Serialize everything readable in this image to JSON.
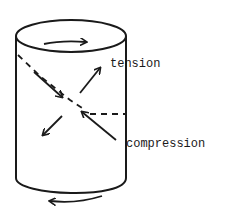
{
  "figure": {
    "type": "diagram",
    "labels": {
      "tension": "tension",
      "compression": "compression"
    },
    "elements": [
      {
        "name": "cylinder",
        "description": "vertical cylinder with elliptical top and curved bottom"
      },
      {
        "name": "top-rotation-arrow",
        "direction": "right"
      },
      {
        "name": "bottom-rotation-arrow",
        "direction": "left"
      },
      {
        "name": "tension-arrows",
        "description": "pair of arrows pointing outward along diagonal (up-right / down-left)"
      },
      {
        "name": "compression-arrows",
        "description": "pair of arrows pointing inward along other diagonal (from upper-left and lower-right toward center)"
      },
      {
        "name": "dashed-helix",
        "description": "dashed line wrapping diagonally across cylinder surface"
      }
    ],
    "stroke_color": "#1a1a1a",
    "background_color": "#ffffff"
  }
}
